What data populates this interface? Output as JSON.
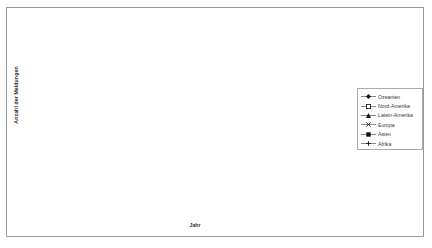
{
  "chart_data": {
    "type": "line",
    "title": "",
    "xlabel": "Jahr",
    "ylabel": "Anzahl der Meldungen",
    "categories": [
      "1997",
      "1998",
      "1999",
      "2000",
      "2001",
      "2002",
      "2003",
      "2004",
      "2005",
      "2006"
    ],
    "ylim": [
      0,
      1800
    ],
    "yticks": [
      0,
      300,
      600,
      900,
      1200,
      1500,
      1800
    ],
    "grid": true,
    "legend_position": "right",
    "series": [
      {
        "name": "Ozeanien",
        "marker": "filled-diamond",
        "values": [
          5,
          10,
          12,
          15,
          18,
          20,
          22,
          25,
          28,
          30
        ]
      },
      {
        "name": "Nord-Amerika",
        "marker": "open-square",
        "values": [
          8,
          12,
          20,
          28,
          35,
          42,
          55,
          62,
          110,
          215
        ]
      },
      {
        "name": "Latein-Amerika",
        "marker": "filled-triangle",
        "values": [
          10,
          35,
          90,
          170,
          270,
          460,
          545,
          730,
          970,
          905
        ]
      },
      {
        "name": "Europa",
        "marker": "cross",
        "values": [
          6,
          10,
          15,
          22,
          30,
          75,
          110,
          150,
          185,
          225
        ]
      },
      {
        "name": "Asien",
        "marker": "filled-square",
        "values": [
          15,
          75,
          145,
          235,
          330,
          780,
          1300,
          1270,
          1600,
          1230
        ]
      },
      {
        "name": "Afrika",
        "marker": "plus",
        "values": [
          2,
          3,
          4,
          5,
          6,
          7,
          8,
          9,
          10,
          12
        ]
      }
    ],
    "low_cluster_series": [
      {
        "name": "low-flat-square",
        "values": [
          18,
          60,
          110,
          140,
          170,
          200,
          215,
          220,
          225,
          230
        ]
      }
    ]
  },
  "legend": {
    "items": [
      {
        "label": "Ozeanien"
      },
      {
        "label": "Nord-Amerika"
      },
      {
        "label": "Latein-Amerika"
      },
      {
        "label": "Europa"
      },
      {
        "label": "Asien"
      },
      {
        "label": "Afrika"
      }
    ]
  },
  "axes": {
    "y_title": "Anzahl der Meldungen",
    "x_title": "Jahr"
  },
  "colors": {
    "line": "#555555",
    "marker": "#111111",
    "grid": "#8c8c8c",
    "frame": "#9a9a9a",
    "text": "#3a3a3a"
  }
}
